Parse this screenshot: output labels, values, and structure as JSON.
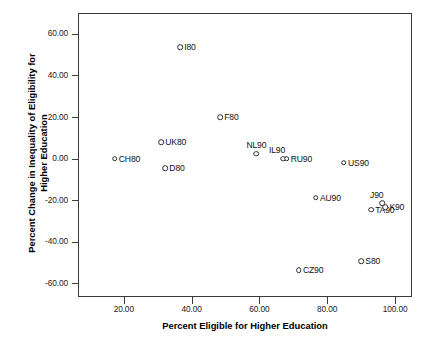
{
  "chart_data": {
    "type": "scatter",
    "title": "",
    "xlabel": "Percent Eligible for Higher Education",
    "ylabel": "Percent Change in Inequality of Eligibility for Higher Education",
    "ylabel_line1": "Percent Change in Inequality of Eligibility for",
    "ylabel_line2": "Higher Education",
    "xlim": [
      6.5,
      105.0
    ],
    "ylim": [
      -66.5,
      70.0
    ],
    "xticks": [
      20,
      40,
      60,
      80,
      100
    ],
    "xticklabels": [
      "20.00",
      "40.00",
      "60.00",
      "80.00",
      "100.00"
    ],
    "yticks": [
      60,
      40,
      20,
      0,
      -20,
      -40,
      -60
    ],
    "yticklabels": [
      "60.00",
      "40.00",
      "20.00",
      "0.00",
      "-20.00",
      "-40.00",
      "-60.00"
    ],
    "grid": false,
    "legend": null,
    "marker": "open-circle",
    "points": [
      {
        "label": "CH80",
        "x": 17.3,
        "y": 0.0,
        "label_pos": "right"
      },
      {
        "label": "UK80",
        "x": 31.0,
        "y": 8.0,
        "label_pos": "right"
      },
      {
        "label": "D80",
        "x": 32.2,
        "y": -4.5,
        "label_pos": "right"
      },
      {
        "label": "I80",
        "x": 36.6,
        "y": 53.5,
        "label_pos": "right"
      },
      {
        "label": "F80",
        "x": 48.4,
        "y": 19.8,
        "label_pos": "right"
      },
      {
        "label": "NL90",
        "x": 59.1,
        "y": 2.4,
        "label_pos": "above"
      },
      {
        "label": "IL90",
        "x": 67.1,
        "y": 0.0,
        "label_pos": "aboveleft"
      },
      {
        "label": "RU90",
        "x": 68.0,
        "y": 0.0,
        "label_pos": "right"
      },
      {
        "label": "CZ90",
        "x": 71.6,
        "y": -53.6,
        "label_pos": "right"
      },
      {
        "label": "AU90",
        "x": 76.6,
        "y": -18.8,
        "label_pos": "right"
      },
      {
        "label": "US90",
        "x": 84.9,
        "y": -1.9,
        "label_pos": "right"
      },
      {
        "label": "S80",
        "x": 90.0,
        "y": -49.3,
        "label_pos": "right"
      },
      {
        "label": "TA90",
        "x": 92.9,
        "y": -24.6,
        "label_pos": "right"
      },
      {
        "label": "J90",
        "x": 96.2,
        "y": -21.3,
        "label_pos": "aboveleft"
      },
      {
        "label": "K90",
        "x": 97.1,
        "y": -23.2,
        "label_pos": "right"
      }
    ]
  }
}
